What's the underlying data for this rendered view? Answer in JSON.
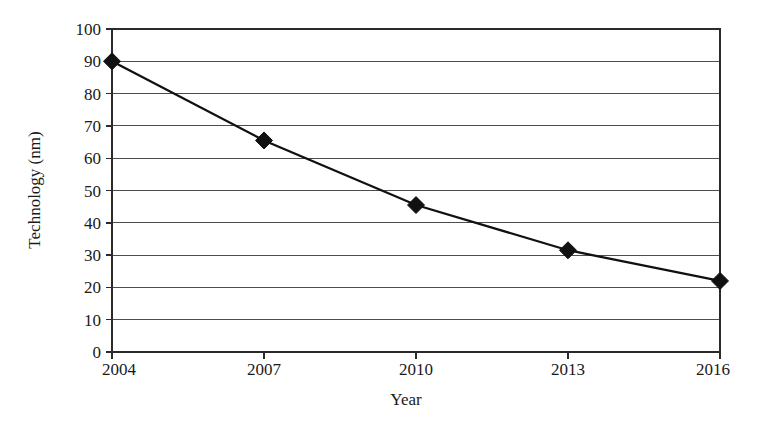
{
  "chart_data": {
    "type": "line",
    "title": "",
    "subtitle": "",
    "xlabel": "Year",
    "ylabel": "Technology (nm)",
    "x": [
      2004,
      2007,
      2010,
      2013,
      2016
    ],
    "categories": [
      "2004",
      "2007",
      "2010",
      "2013",
      "2016"
    ],
    "values": [
      90,
      65.5,
      45.5,
      31.5,
      22
    ],
    "series": [
      {
        "name": "Technology node",
        "values": [
          90,
          65.5,
          45.5,
          31.5,
          22
        ]
      }
    ],
    "xlim": [
      2004,
      2016
    ],
    "ylim": [
      0,
      100
    ],
    "y_ticks": [
      0,
      10,
      20,
      30,
      40,
      50,
      60,
      70,
      80,
      90,
      100
    ],
    "y_tick_labels": [
      "0",
      "10",
      "20",
      "30",
      "40",
      "50",
      "60",
      "70",
      "80",
      "90",
      "100"
    ],
    "x_ticks": [
      2004,
      2007,
      2010,
      2013,
      2016
    ],
    "x_tick_labels": [
      "2004",
      "2007",
      "2010",
      "2013",
      "2016"
    ],
    "grid": "horizontal",
    "legend": "none",
    "marker": "diamond",
    "marker_color": "#111111",
    "line_color": "#111111",
    "grid_color": "#4d4d4d",
    "background_color": "#ffffff",
    "annotations": []
  }
}
